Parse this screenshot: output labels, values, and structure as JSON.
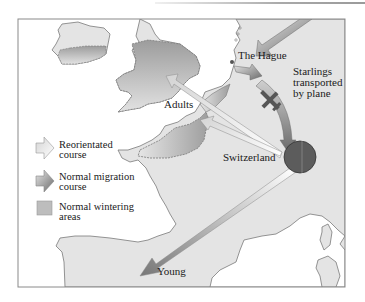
{
  "diagram": {
    "colors": {
      "land": "#e4e4e4",
      "land_outline": "#7a7a7a",
      "wintering_area": "#a8a8a8",
      "normal_arrow": "#6f6f6f",
      "reoriented_arrow": "#dedede",
      "switzerland_circle": "#5c5c5c",
      "frame": "#8a8a8a",
      "sea": "#ffffff"
    },
    "labels": {
      "the_hague": "The Hague",
      "starlings_line1": "Starlings",
      "starlings_line2": "transported",
      "starlings_line3": "by plane",
      "adults": "Adults",
      "switzerland": "Switzerland",
      "young": "Young"
    },
    "legend": {
      "items": [
        {
          "icon": "light-arrow-icon",
          "line1": "Reorientated",
          "line2": "course"
        },
        {
          "icon": "dark-arrow-icon",
          "line1": "Normal migration",
          "line2": "course"
        },
        {
          "icon": "gray-square-icon",
          "line1": "Normal wintering",
          "line2": "areas"
        }
      ]
    },
    "routes": [
      {
        "name": "normal-migration-to-hague",
        "from": "north-east",
        "to": "The Hague",
        "style": "normal"
      },
      {
        "name": "plane-transport",
        "from": "The Hague",
        "to": "Switzerland",
        "style": "normal"
      },
      {
        "name": "adults-to-britain",
        "from": "Switzerland",
        "to": "Southern England",
        "style": "reoriented"
      },
      {
        "name": "adults-to-france-nw",
        "from": "Switzerland",
        "to": "North-west France",
        "style": "reoriented"
      },
      {
        "name": "young-to-spain",
        "from": "Switzerland",
        "to": "Spain",
        "style": "gradient"
      }
    ]
  }
}
